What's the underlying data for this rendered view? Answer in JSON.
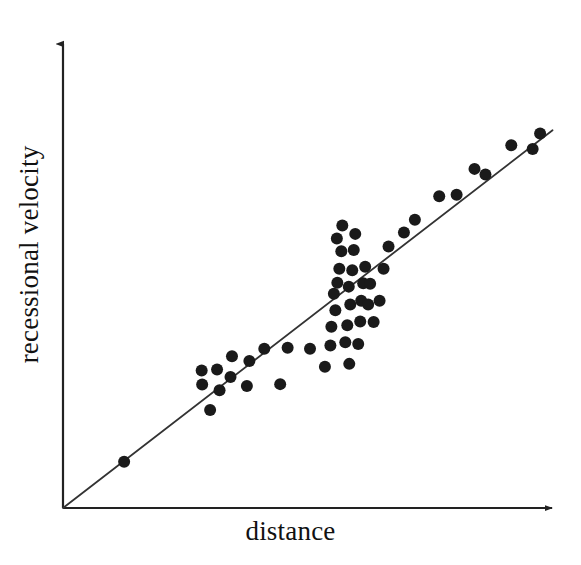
{
  "figure": {
    "width": 581,
    "height": 565,
    "background": "#ffffff",
    "ink_color": "#111111",
    "point_color": "#1a1a1a",
    "line_color": "#333333"
  },
  "chart_data": {
    "type": "scatter",
    "title": "",
    "subtitle": "",
    "xlabel": "distance",
    "ylabel": "recessional velocity",
    "grid": false,
    "legend": null,
    "legend_position": "none",
    "tick_labels_x": [],
    "tick_labels_y": [],
    "axis_style": "arrow-headed open axes, no ticks, no tick labels",
    "xlim": [
      0,
      1
    ],
    "ylim": [
      0,
      1
    ],
    "fit_line": {
      "label": "",
      "through_origin": true,
      "x": [
        0.0,
        0.985
      ],
      "y": [
        0.0,
        0.802
      ]
    },
    "marker": {
      "shape": "circle",
      "radius_px": 6.0,
      "filled": true
    },
    "points": [
      {
        "x": 0.123,
        "y": 0.098
      },
      {
        "x": 0.296,
        "y": 0.208
      },
      {
        "x": 0.28,
        "y": 0.262
      },
      {
        "x": 0.315,
        "y": 0.25
      },
      {
        "x": 0.31,
        "y": 0.294
      },
      {
        "x": 0.279,
        "y": 0.292
      },
      {
        "x": 0.337,
        "y": 0.278
      },
      {
        "x": 0.34,
        "y": 0.322
      },
      {
        "x": 0.37,
        "y": 0.259
      },
      {
        "x": 0.375,
        "y": 0.312
      },
      {
        "x": 0.405,
        "y": 0.338
      },
      {
        "x": 0.437,
        "y": 0.263
      },
      {
        "x": 0.452,
        "y": 0.34
      },
      {
        "x": 0.497,
        "y": 0.338
      },
      {
        "x": 0.527,
        "y": 0.3
      },
      {
        "x": 0.538,
        "y": 0.345
      },
      {
        "x": 0.54,
        "y": 0.385
      },
      {
        "x": 0.548,
        "y": 0.42
      },
      {
        "x": 0.545,
        "y": 0.455
      },
      {
        "x": 0.552,
        "y": 0.478
      },
      {
        "x": 0.556,
        "y": 0.508
      },
      {
        "x": 0.56,
        "y": 0.545
      },
      {
        "x": 0.551,
        "y": 0.572
      },
      {
        "x": 0.562,
        "y": 0.6
      },
      {
        "x": 0.568,
        "y": 0.352
      },
      {
        "x": 0.572,
        "y": 0.388
      },
      {
        "x": 0.578,
        "y": 0.432
      },
      {
        "x": 0.575,
        "y": 0.47
      },
      {
        "x": 0.582,
        "y": 0.505
      },
      {
        "x": 0.585,
        "y": 0.548
      },
      {
        "x": 0.588,
        "y": 0.582
      },
      {
        "x": 0.594,
        "y": 0.348
      },
      {
        "x": 0.598,
        "y": 0.396
      },
      {
        "x": 0.6,
        "y": 0.44
      },
      {
        "x": 0.604,
        "y": 0.477
      },
      {
        "x": 0.608,
        "y": 0.512
      },
      {
        "x": 0.614,
        "y": 0.432
      },
      {
        "x": 0.618,
        "y": 0.476
      },
      {
        "x": 0.576,
        "y": 0.306
      },
      {
        "x": 0.625,
        "y": 0.395
      },
      {
        "x": 0.637,
        "y": 0.44
      },
      {
        "x": 0.645,
        "y": 0.508
      },
      {
        "x": 0.655,
        "y": 0.555
      },
      {
        "x": 0.686,
        "y": 0.585
      },
      {
        "x": 0.708,
        "y": 0.612
      },
      {
        "x": 0.757,
        "y": 0.662
      },
      {
        "x": 0.792,
        "y": 0.665
      },
      {
        "x": 0.828,
        "y": 0.72
      },
      {
        "x": 0.85,
        "y": 0.708
      },
      {
        "x": 0.902,
        "y": 0.77
      },
      {
        "x": 0.945,
        "y": 0.762
      },
      {
        "x": 0.96,
        "y": 0.795
      }
    ]
  }
}
